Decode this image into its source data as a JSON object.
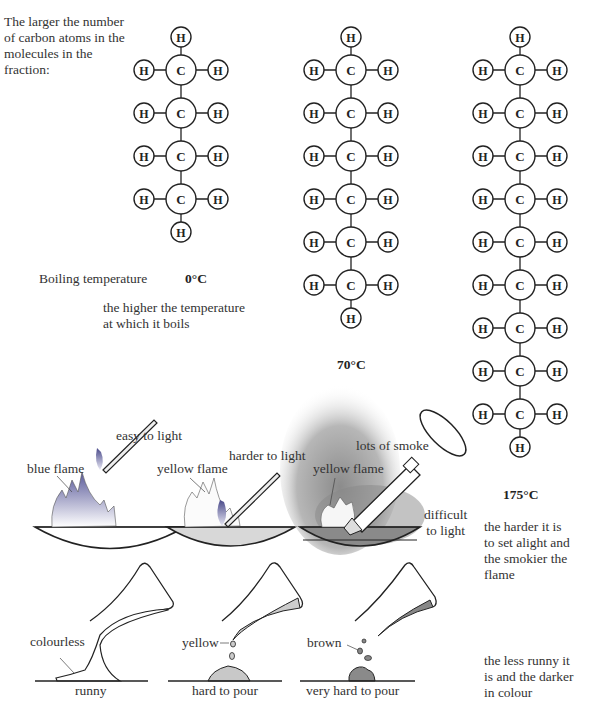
{
  "intro": {
    "lines": [
      "The larger the number",
      "of carbon atoms in the",
      "molecules in the",
      "fraction:"
    ]
  },
  "molecules": [
    {
      "name": "butane-like",
      "carbon_count": 4,
      "boiling_temperature": "0°C"
    },
    {
      "name": "hexane-like",
      "carbon_count": 6,
      "boiling_temperature": "70°C"
    },
    {
      "name": "nonane-like",
      "carbon_count": 9,
      "boiling_temperature": "175°C"
    }
  ],
  "atom_labels": {
    "carbon": "C",
    "hydrogen": "H"
  },
  "boiling": {
    "label": "Boiling temperature",
    "trend_lines": [
      "the higher the temperature",
      "at which it boils"
    ]
  },
  "flammability": {
    "panels": [
      {
        "flame_label": "blue flame",
        "lighting_label": "easy to light"
      },
      {
        "flame_label": "yellow flame",
        "lighting_label": "harder to light"
      },
      {
        "flame_label": "yellow flame",
        "lighting_label_lines": [
          "difficult",
          "to light"
        ],
        "smoke_label": "lots of smoke"
      }
    ],
    "trend_lines": [
      "the harder it is",
      "to set alight and",
      "the smokier the",
      "flame"
    ]
  },
  "viscosity": {
    "panels": [
      {
        "colour_label": "colourless",
        "pour_label": "runny"
      },
      {
        "colour_label": "yellow",
        "pour_label": "hard to pour"
      },
      {
        "colour_label": "brown",
        "pour_label": "very hard to pour"
      }
    ],
    "trend_lines": [
      "the less runny it",
      "is and the darker",
      "in colour"
    ]
  },
  "colors": {
    "blue_flame": "#6a6aa8",
    "liquid_light": "#d4d4d4",
    "liquid_yellow": "#c8c8c8",
    "liquid_brown": "#8a8a8a",
    "smoke": "#9a9a9a"
  }
}
